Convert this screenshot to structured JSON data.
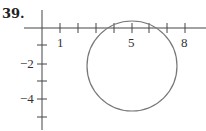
{
  "problem": {
    "number": "39."
  },
  "graph": {
    "x_tick_labels": [
      {
        "value": 1,
        "label": "1"
      },
      {
        "value": 5,
        "label": "5"
      },
      {
        "value": 8,
        "label": "8"
      }
    ],
    "y_tick_labels": [
      {
        "value": -2,
        "label": "−2"
      },
      {
        "value": -4,
        "label": "−4"
      }
    ],
    "circle": {
      "center": [
        5,
        -2
      ],
      "description": "circle graph"
    },
    "colors": {
      "axis": "#444444",
      "circle": "#777777"
    }
  }
}
